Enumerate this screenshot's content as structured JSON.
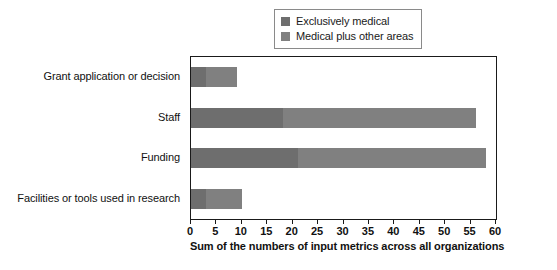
{
  "chart_data": {
    "type": "bar",
    "orientation": "horizontal",
    "stacked": true,
    "title": "",
    "xlabel": "Sum of the numbers of input metrics across all organizations",
    "ylabel": "",
    "xlim": [
      0,
      60
    ],
    "xticks": [
      0,
      5,
      10,
      15,
      20,
      25,
      30,
      35,
      40,
      45,
      50,
      55,
      60
    ],
    "grid": false,
    "legend_position": "top-center",
    "categories": [
      "Grant application or decision",
      "Staff",
      "Funding",
      "Facilities or tools used in research"
    ],
    "series": [
      {
        "name": "Exclusively medical",
        "color": "#6e6e6e",
        "values": [
          3,
          18,
          21,
          3
        ]
      },
      {
        "name": "Medical plus other areas",
        "color": "#808080",
        "values": [
          6,
          38,
          37,
          7
        ]
      }
    ],
    "totals": [
      9,
      56,
      58,
      10
    ]
  },
  "legend": {
    "items": [
      {
        "label": "Exclusively medical",
        "color": "#6e6e6e"
      },
      {
        "label": "Medical plus other areas",
        "color": "#808080"
      }
    ]
  },
  "axis": {
    "title": "Sum of the numbers of input metrics across all organizations",
    "ticks": [
      "0",
      "5",
      "10",
      "15",
      "20",
      "25",
      "30",
      "35",
      "40",
      "45",
      "50",
      "55",
      "60"
    ]
  },
  "colors": {
    "frame": "#1a1a1a",
    "background": "#ffffff",
    "series_a": "#6e6e6e",
    "series_b": "#808080",
    "legend_border": "#8a8a8a"
  }
}
